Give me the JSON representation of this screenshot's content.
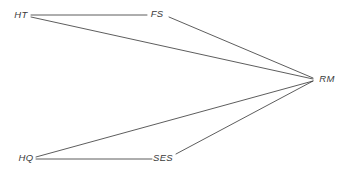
{
  "diagram": {
    "type": "path-diagram",
    "background_color": "#ffffff",
    "edge_color": "#333333",
    "label_color": "#3a3a3a",
    "canvas": {
      "width": 347,
      "height": 172
    },
    "nodes": [
      {
        "id": "HT",
        "label": "HT",
        "x": 21,
        "y": 15
      },
      {
        "id": "FS",
        "label": "FS",
        "x": 157,
        "y": 14
      },
      {
        "id": "RM",
        "label": "RM",
        "x": 327,
        "y": 79
      },
      {
        "id": "HQ",
        "label": "HQ",
        "x": 26,
        "y": 158
      },
      {
        "id": "SES",
        "label": "SES",
        "x": 163,
        "y": 158
      }
    ],
    "edges": [
      {
        "id": "ht-fs",
        "from": "HT",
        "to": "FS",
        "x1": 31,
        "y1": 15,
        "x2": 147,
        "y2": 15
      },
      {
        "id": "ht-rm",
        "from": "HT",
        "to": "RM",
        "x1": 31,
        "y1": 17,
        "x2": 313,
        "y2": 79
      },
      {
        "id": "fs-rm",
        "from": "FS",
        "to": "RM",
        "x1": 169,
        "y1": 17,
        "x2": 313,
        "y2": 78
      },
      {
        "id": "hq-ses",
        "from": "HQ",
        "to": "SES",
        "x1": 36,
        "y1": 159,
        "x2": 152,
        "y2": 159
      },
      {
        "id": "hq-rm",
        "from": "HQ",
        "to": "RM",
        "x1": 36,
        "y1": 157,
        "x2": 313,
        "y2": 81
      },
      {
        "id": "ses-rm",
        "from": "SES",
        "to": "RM",
        "x1": 176,
        "y1": 154,
        "x2": 313,
        "y2": 81
      }
    ]
  }
}
